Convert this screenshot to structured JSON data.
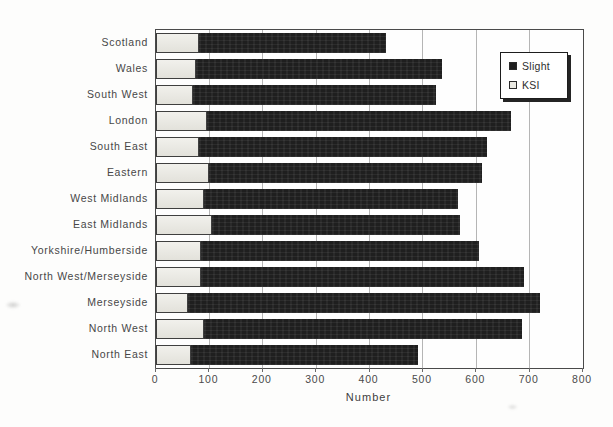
{
  "chart_data": {
    "type": "bar",
    "orientation": "horizontal",
    "stacked": true,
    "title": "",
    "xlabel": "Number",
    "ylabel": "",
    "xlim": [
      0,
      800
    ],
    "xticks": [
      0,
      100,
      200,
      300,
      400,
      500,
      600,
      700,
      800
    ],
    "grid": true,
    "categories": [
      "Scotland",
      "Wales",
      "South West",
      "London",
      "South East",
      "Eastern",
      "West Midlands",
      "East Midlands",
      "Yorkshire/Humberside",
      "North West/Merseyside",
      "Merseyside",
      "North West",
      "North East"
    ],
    "series": [
      {
        "name": "KSI",
        "color": "#eae9e2",
        "border_color": "#3f3f3f",
        "values": [
          80,
          75,
          70,
          95,
          80,
          100,
          90,
          105,
          85,
          85,
          60,
          90,
          65
        ]
      },
      {
        "name": "Slight",
        "color": "#1f1f1f",
        "border_color": "#1f1f1f",
        "values": [
          350,
          460,
          455,
          570,
          540,
          510,
          475,
          465,
          520,
          605,
          660,
          595,
          425
        ]
      }
    ],
    "bar_totals": [
      430,
      535,
      525,
      665,
      620,
      610,
      565,
      570,
      605,
      690,
      720,
      685,
      490
    ],
    "legend": {
      "position": "top-right",
      "entries": [
        "Slight",
        "KSI"
      ]
    }
  },
  "colors": {
    "slight": "#1f1f1f",
    "ksi": "#eae9e2",
    "gridline": "#b5b5b5",
    "plot_border": "#4a4a4a",
    "text": "#474747",
    "background": "#fdfdfc"
  }
}
